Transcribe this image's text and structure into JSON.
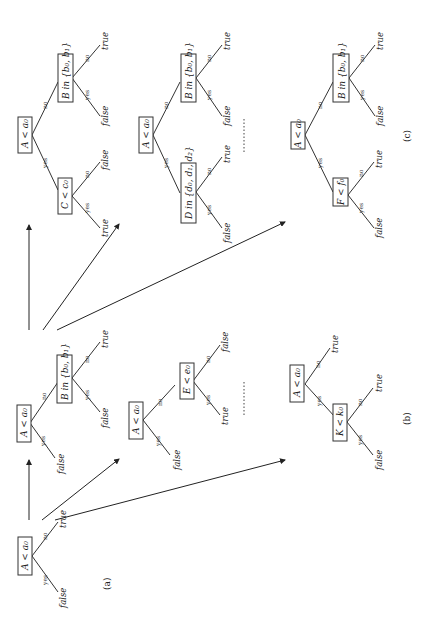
{
  "captions": {
    "a": "(a)",
    "b": "(b)",
    "c": "(c)"
  },
  "edge_labels": {
    "yes": "yes",
    "no": "no"
  },
  "leaves": {
    "true": "true",
    "false": "false"
  },
  "tree_a": {
    "root": "A < a₀",
    "yes_leaf": "false",
    "no_leaf": "true"
  },
  "tree_b1": {
    "root": "A < a₀",
    "yes_leaf": "false",
    "no_node": "B in {b₀, b₁}",
    "no_node_yes_leaf": "false",
    "no_node_no_leaf": "true"
  },
  "tree_b2": {
    "root": "A < a₀",
    "yes_leaf": "false",
    "no_node": "E < e₀",
    "no_node_yes_leaf": "true",
    "no_node_no_leaf": "false"
  },
  "tree_b3": {
    "root": "A < a₀",
    "yes_node": "K < k₀",
    "yes_node_yes_leaf": "false",
    "yes_node_no_leaf": "true",
    "no_leaf": "true"
  },
  "tree_c1": {
    "root": "A < a₀",
    "yes_node": "C < c₀",
    "yes_node_yes_leaf": "true",
    "yes_node_no_leaf": "false",
    "no_node": "B in {b₀, b₁}",
    "no_node_yes_leaf": "false",
    "no_node_no_leaf": "true"
  },
  "tree_c2": {
    "root": "A < a₀",
    "yes_node": "D in {d₀, d₁, d₂}",
    "yes_node_yes_leaf": "false",
    "yes_node_no_leaf": "true",
    "no_node": "B in {b₀, b₁}",
    "no_node_yes_leaf": "false",
    "no_node_no_leaf": "true"
  },
  "tree_c3": {
    "root": "A < a₀",
    "yes_node": "F < f₀",
    "yes_node_yes_leaf": "false",
    "yes_node_no_leaf": "true",
    "no_node": "B in {b₀, b₁}",
    "no_node_yes_leaf": "false",
    "no_node_no_leaf": "true"
  }
}
